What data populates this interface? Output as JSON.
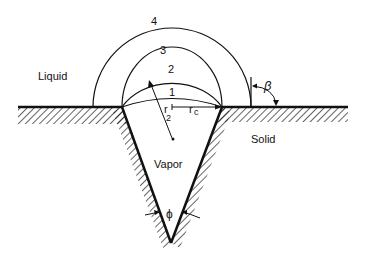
{
  "diagram": {
    "regions": {
      "liquid": "Liquid",
      "solid": "Solid",
      "vapor": "Vapor"
    },
    "interface_labels": [
      "1",
      "2",
      "3",
      "4"
    ],
    "symbols": {
      "beta": "β",
      "phi": "ϕ",
      "r2_main": "r",
      "r2_sub": "2",
      "rc_main": "r",
      "rc_sub": "c"
    },
    "colors": {
      "line": "#111111",
      "background": "#ffffff"
    }
  }
}
